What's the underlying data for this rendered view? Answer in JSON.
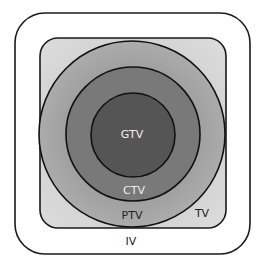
{
  "diagram": {
    "type": "nested-volumes",
    "regions": [
      {
        "id": "iv",
        "label": "IV",
        "shape": "rounded-square",
        "fill": "#ffffff",
        "label_color": "#222222"
      },
      {
        "id": "tv",
        "label": "TV",
        "shape": "rounded-square",
        "fill": "#d2d2d2",
        "label_color": "#222222"
      },
      {
        "id": "ptv",
        "label": "PTV",
        "shape": "circle",
        "fill": "#a8a8a8",
        "label_color": "#222222"
      },
      {
        "id": "ctv",
        "label": "CTV",
        "shape": "circle",
        "fill": "#7a7a7a",
        "label_color": "#eeeeee"
      },
      {
        "id": "gtv",
        "label": "GTV",
        "shape": "circle",
        "fill": "#555555",
        "label_color": "#eeeeee"
      }
    ]
  }
}
